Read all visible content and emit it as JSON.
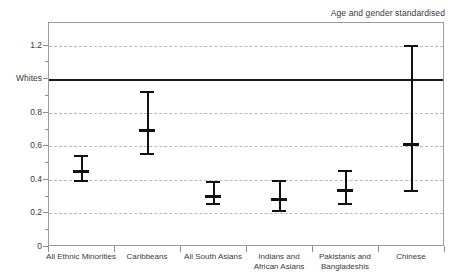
{
  "chart_data": {
    "type": "scatter",
    "title": "",
    "annotation": "Age and gender standardised",
    "xlabel": "",
    "ylabel": "",
    "ylim": [
      0,
      1.3
    ],
    "grid": true,
    "reference_line": {
      "label": "Whites",
      "value": 1.0
    },
    "yticks": [
      {
        "label": "1.2",
        "value": 1.2
      },
      {
        "label": "Whites",
        "value": 1.0
      },
      {
        "label": "0.8",
        "value": 0.8
      },
      {
        "label": "0.6",
        "value": 0.6
      },
      {
        "label": "0.4",
        "value": 0.4
      },
      {
        "label": "0.2",
        "value": 0.2
      },
      {
        "label": "0",
        "value": 0
      }
    ],
    "categories": [
      "All Ethnic Minorities",
      "Caribbeans",
      "All South Asians",
      "Indians and\nAfrican Asians",
      "Pakistanis and\nBangladeshis",
      "Chinese"
    ],
    "series": [
      {
        "name": "Odds ratio",
        "points": [
          {
            "category": "All Ethnic Minorities",
            "value": 0.455,
            "low": 0.38,
            "high": 0.54
          },
          {
            "category": "Caribbeans",
            "value": 0.7,
            "low": 0.545,
            "high": 0.925
          },
          {
            "category": "All South Asians",
            "value": 0.305,
            "low": 0.245,
            "high": 0.39
          },
          {
            "category": "Indians and African Asians",
            "value": 0.285,
            "low": 0.205,
            "high": 0.395
          },
          {
            "category": "Pakistanis and Bangladeshis",
            "value": 0.34,
            "low": 0.245,
            "high": 0.455
          },
          {
            "category": "Chinese",
            "value": 0.615,
            "low": 0.32,
            "high": 1.195
          }
        ]
      }
    ]
  },
  "colors": {
    "marker": "#111111",
    "grid": "#b9b9b9",
    "frame": "#9a9a9a",
    "reference": "#1a1a1a",
    "text": "#3a3a3a"
  }
}
